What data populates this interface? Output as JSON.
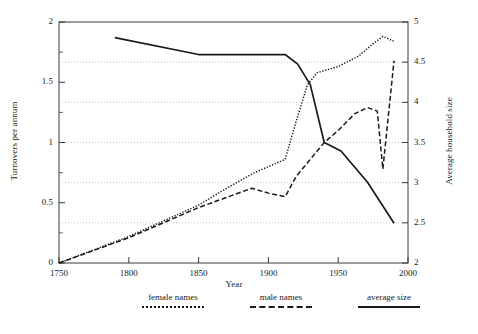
{
  "chart_data": {
    "type": "line",
    "title": "",
    "xlabel": "Year",
    "ylabel": "Turnovers per annum",
    "ylabel_right": "Average household size",
    "xlim": [
      1750,
      2000
    ],
    "ylim": [
      0,
      2
    ],
    "ylim_right": [
      2,
      5
    ],
    "xticks": [
      1750,
      1800,
      1850,
      1900,
      1950,
      2000
    ],
    "yticks": [
      0,
      0.5,
      1,
      1.5,
      2
    ],
    "yticks_right": [
      2,
      2.5,
      3,
      3.5,
      4,
      4.5,
      5
    ],
    "yticks_minor": [
      0.25,
      0.75,
      1.25,
      1.75
    ],
    "grid": "horizontal-dotted",
    "legend_position": "below",
    "series": [
      {
        "name": "female names",
        "style": "dotted",
        "axis": "left",
        "points": [
          [
            1750,
            0.0
          ],
          [
            1800,
            0.22
          ],
          [
            1850,
            0.48
          ],
          [
            1870,
            0.62
          ],
          [
            1890,
            0.75
          ],
          [
            1912,
            0.86
          ],
          [
            1920,
            1.18
          ],
          [
            1928,
            1.48
          ],
          [
            1935,
            1.58
          ],
          [
            1950,
            1.63
          ],
          [
            1965,
            1.72
          ],
          [
            1975,
            1.82
          ],
          [
            1982,
            1.88
          ],
          [
            1990,
            1.84
          ]
        ]
      },
      {
        "name": "male names",
        "style": "dashed",
        "axis": "left",
        "points": [
          [
            1750,
            0.0
          ],
          [
            1800,
            0.21
          ],
          [
            1850,
            0.46
          ],
          [
            1888,
            0.62
          ],
          [
            1900,
            0.58
          ],
          [
            1912,
            0.55
          ],
          [
            1920,
            0.72
          ],
          [
            1930,
            0.86
          ],
          [
            1940,
            1.0
          ],
          [
            1950,
            1.1
          ],
          [
            1962,
            1.24
          ],
          [
            1971,
            1.29
          ],
          [
            1978,
            1.26
          ],
          [
            1982,
            0.78
          ],
          [
            1990,
            1.68
          ]
        ]
      },
      {
        "name": "average size",
        "style": "solid",
        "axis": "right",
        "points": [
          [
            1790,
            1.87
          ],
          [
            1850,
            1.73
          ],
          [
            1912,
            1.73
          ],
          [
            1921,
            1.65
          ],
          [
            1930,
            1.48
          ],
          [
            1940,
            1.0
          ],
          [
            1952,
            0.93
          ],
          [
            1971,
            0.67
          ],
          [
            1990,
            0.33
          ]
        ],
        "points_right_axis": [
          [
            1790,
            4.8
          ],
          [
            1850,
            4.6
          ],
          [
            1912,
            4.6
          ],
          [
            1921,
            4.47
          ],
          [
            1930,
            4.22
          ],
          [
            1940,
            3.5
          ],
          [
            1952,
            3.4
          ],
          [
            1971,
            3.0
          ],
          [
            1990,
            2.5
          ]
        ]
      }
    ]
  },
  "legend": {
    "items": [
      {
        "label": "female names",
        "style": "dotted"
      },
      {
        "label": "male names",
        "style": "dashed"
      },
      {
        "label": "average size",
        "style": "solid"
      }
    ]
  },
  "colors": {
    "line": "#1a1a1a",
    "grid": "#b8b8b8",
    "axis": "#3a3a3a",
    "background": "#ffffff"
  }
}
